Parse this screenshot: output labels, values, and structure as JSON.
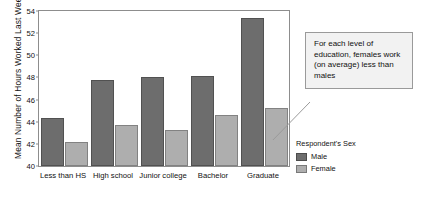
{
  "chart_data": {
    "type": "bar",
    "title": "",
    "xlabel": "",
    "ylabel": "Mean Number of Hours Worked Last Week",
    "ylim": [
      40,
      54
    ],
    "yticks": [
      40,
      42,
      44,
      46,
      48,
      50,
      52,
      54
    ],
    "grid": false,
    "legend_position": "right",
    "legend_title": "Respondent's Sex",
    "categories": [
      "Less than HS",
      "High school",
      "Junior college",
      "Bachelor",
      "Graduate"
    ],
    "series": [
      {
        "name": "Male",
        "color": "#6d6d6d",
        "values": [
          44.35,
          47.8,
          48.05,
          48.15,
          53.4
        ]
      },
      {
        "name": "Female",
        "color": "#aeaeae",
        "values": [
          42.2,
          43.7,
          43.25,
          44.65,
          45.2
        ]
      }
    ],
    "annotations": [
      {
        "text": "For each level of education, females work (on average) less than males"
      }
    ]
  },
  "callout": {
    "text": "For each level of education, females work (on average) less than males"
  }
}
